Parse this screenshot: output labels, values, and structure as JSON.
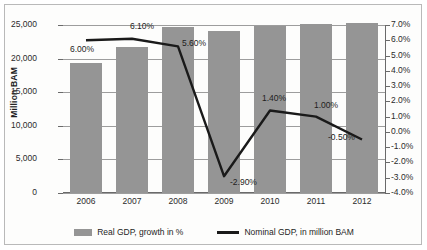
{
  "chart_data": {
    "type": "bar",
    "title": "",
    "categories": [
      "2006",
      "2007",
      "2008",
      "2009",
      "2010",
      "2011",
      "2012"
    ],
    "series": [
      {
        "name": "Real GDP, growth in %",
        "render": "bar",
        "axis": "left",
        "unit": "Million BAM",
        "color": "#959595",
        "values": [
          19400,
          21800,
          24750,
          24100,
          24800,
          25100,
          25300
        ]
      },
      {
        "name": "Nominal GDP, in million BAM",
        "render": "line",
        "axis": "right",
        "unit": "%",
        "color": "#1a1a1a",
        "values": [
          6.0,
          6.1,
          5.6,
          -2.9,
          1.4,
          1.0,
          -0.5
        ],
        "point_labels": [
          "6.00%",
          "6.10%",
          "5.60%",
          "-2.90%",
          "1.40%",
          "1.00%",
          "-0.50%"
        ]
      }
    ],
    "xlabel": "",
    "ylabel": "Million BAM",
    "ylim": [
      0,
      25000
    ],
    "y2lim": [
      -4.0,
      7.0
    ],
    "yticks": [
      0,
      5000,
      10000,
      15000,
      20000,
      25000
    ],
    "ytick_labels": [
      "0",
      "5,000",
      "10,000",
      "15,000",
      "20,000",
      "25,000"
    ],
    "y2ticks": [
      -4.0,
      -3.0,
      -2.0,
      -1.0,
      0.0,
      1.0,
      2.0,
      3.0,
      4.0,
      5.0,
      6.0,
      7.0
    ],
    "y2tick_labels": [
      "-4.0%",
      "-3.0%",
      "-2.0%",
      "-1.0%",
      "0.0%",
      "1.0%",
      "2.0%",
      "3.0%",
      "4.0%",
      "5.0%",
      "6.0%",
      "7.0%"
    ],
    "grid": true,
    "legend_position": "bottom"
  },
  "legend": {
    "items": [
      {
        "label": "Real GDP, growth in %",
        "marker": "bar-swatch-icon"
      },
      {
        "label": "Nominal GDP, in million BAM",
        "marker": "line-swatch-icon"
      }
    ]
  }
}
